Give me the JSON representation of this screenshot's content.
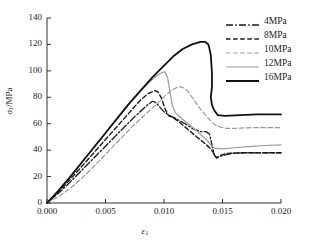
{
  "chart_data": {
    "type": "line",
    "title": "",
    "xlabel": "ε₁",
    "ylabel": "σ₁/MPa",
    "xlabel_main": "ε",
    "xlabel_sub": "1",
    "ylabel_main": "σ",
    "ylabel_sub": "1",
    "ylabel_unit": "/MPa",
    "xlim": [
      0.0,
      0.02
    ],
    "ylim": [
      0,
      140
    ],
    "xticks": [
      0.0,
      0.005,
      0.01,
      0.015,
      0.02
    ],
    "xtick_labels": [
      "0.000",
      "0.005",
      "0.010",
      "0.015",
      "0.020"
    ],
    "yticks": [
      0,
      20,
      40,
      60,
      80,
      100,
      120,
      140
    ],
    "ytick_labels": [
      "0",
      "20",
      "40",
      "60",
      "80",
      "100",
      "120",
      "140"
    ],
    "grid": false,
    "legend_position": "upper-right",
    "series": [
      {
        "name": "4MPa",
        "label": "4MPa",
        "style": "dashdot",
        "color": "#1a1a1a",
        "width": 1.3,
        "peak_strain": 0.009,
        "peak_stress": 77,
        "residual_stress": 38,
        "points": [
          [
            0.0,
            0
          ],
          [
            0.001,
            7.5
          ],
          [
            0.002,
            16
          ],
          [
            0.003,
            25
          ],
          [
            0.004,
            34
          ],
          [
            0.005,
            43
          ],
          [
            0.006,
            52
          ],
          [
            0.007,
            61
          ],
          [
            0.008,
            69.5
          ],
          [
            0.0085,
            73.5
          ],
          [
            0.009,
            77
          ],
          [
            0.0093,
            76
          ],
          [
            0.0096,
            73
          ],
          [
            0.01,
            69
          ],
          [
            0.0104,
            66.5
          ],
          [
            0.011,
            64
          ],
          [
            0.0118,
            60
          ],
          [
            0.0125,
            56
          ],
          [
            0.0131,
            54
          ],
          [
            0.0136,
            54
          ],
          [
            0.0139,
            52
          ],
          [
            0.0141,
            44
          ],
          [
            0.0143,
            36
          ],
          [
            0.0145,
            34.5
          ],
          [
            0.015,
            36
          ],
          [
            0.0158,
            37.6
          ],
          [
            0.017,
            38
          ],
          [
            0.0185,
            38
          ],
          [
            0.02,
            38
          ]
        ]
      },
      {
        "name": "8MPa",
        "label": "8MPa",
        "style": "dashed",
        "color": "#1a1a1a",
        "width": 1.4,
        "peak_strain": 0.0092,
        "peak_stress": 85,
        "residual_stress": 38,
        "points": [
          [
            0.0,
            0
          ],
          [
            0.001,
            8.5
          ],
          [
            0.002,
            18
          ],
          [
            0.003,
            28
          ],
          [
            0.004,
            38
          ],
          [
            0.005,
            48
          ],
          [
            0.006,
            58
          ],
          [
            0.007,
            68
          ],
          [
            0.008,
            78
          ],
          [
            0.0086,
            82.5
          ],
          [
            0.0092,
            85
          ],
          [
            0.0095,
            84
          ],
          [
            0.0098,
            79
          ],
          [
            0.0101,
            71
          ],
          [
            0.0104,
            66
          ],
          [
            0.0108,
            64.5
          ],
          [
            0.0112,
            62
          ],
          [
            0.012,
            56
          ],
          [
            0.0128,
            50
          ],
          [
            0.0135,
            45
          ],
          [
            0.014,
            41
          ],
          [
            0.0143,
            37
          ],
          [
            0.0145,
            34
          ],
          [
            0.0148,
            36
          ],
          [
            0.0153,
            37.5
          ],
          [
            0.0165,
            38
          ],
          [
            0.018,
            38
          ],
          [
            0.02,
            38
          ]
        ]
      },
      {
        "name": "10MPa",
        "label": "10MPa",
        "style": "dashed",
        "color": "#9a9a9a",
        "width": 1.2,
        "peak_strain": 0.0112,
        "peak_stress": 88,
        "residual_stress": 57,
        "points": [
          [
            0.0,
            0
          ],
          [
            0.0012,
            6
          ],
          [
            0.0024,
            14
          ],
          [
            0.0036,
            24
          ],
          [
            0.0048,
            35
          ],
          [
            0.006,
            46
          ],
          [
            0.0072,
            57
          ],
          [
            0.0084,
            67
          ],
          [
            0.0094,
            75
          ],
          [
            0.0102,
            82
          ],
          [
            0.0108,
            86
          ],
          [
            0.0112,
            88
          ],
          [
            0.0116,
            87.5
          ],
          [
            0.012,
            85
          ],
          [
            0.0124,
            80
          ],
          [
            0.0128,
            75
          ],
          [
            0.0132,
            70
          ],
          [
            0.0136,
            66
          ],
          [
            0.014,
            62
          ],
          [
            0.0144,
            59
          ],
          [
            0.0148,
            57.5
          ],
          [
            0.0153,
            56.5
          ],
          [
            0.016,
            56.5
          ],
          [
            0.0175,
            57
          ],
          [
            0.019,
            57
          ],
          [
            0.02,
            57
          ]
        ]
      },
      {
        "name": "12MPa",
        "label": "12MPa",
        "style": "solid",
        "color": "#9a9a9a",
        "width": 1.2,
        "peak_strain": 0.01,
        "peak_stress": 99,
        "residual_stress": 44,
        "points": [
          [
            0.0,
            0
          ],
          [
            0.001,
            9.5
          ],
          [
            0.002,
            20
          ],
          [
            0.003,
            31
          ],
          [
            0.004,
            42
          ],
          [
            0.005,
            53
          ],
          [
            0.006,
            64
          ],
          [
            0.007,
            75
          ],
          [
            0.008,
            85
          ],
          [
            0.0088,
            92
          ],
          [
            0.0094,
            96.5
          ],
          [
            0.0099,
            99
          ],
          [
            0.0101,
            99
          ],
          [
            0.0103,
            95
          ],
          [
            0.0105,
            85
          ],
          [
            0.0107,
            74
          ],
          [
            0.011,
            68
          ],
          [
            0.0115,
            64
          ],
          [
            0.0122,
            59
          ],
          [
            0.013,
            53
          ],
          [
            0.0136,
            48
          ],
          [
            0.014,
            44
          ],
          [
            0.0143,
            41.5
          ],
          [
            0.015,
            41
          ],
          [
            0.016,
            41.8
          ],
          [
            0.0172,
            42.6
          ],
          [
            0.0186,
            43.5
          ],
          [
            0.02,
            44
          ]
        ]
      },
      {
        "name": "16MPa",
        "label": "16MPa",
        "style": "solid",
        "color": "#111111",
        "width": 1.8,
        "peak_strain": 0.0135,
        "peak_stress": 122,
        "residual_stress": 67,
        "points": [
          [
            0.0,
            0
          ],
          [
            0.001,
            9.5
          ],
          [
            0.002,
            20
          ],
          [
            0.003,
            31
          ],
          [
            0.004,
            42
          ],
          [
            0.005,
            53
          ],
          [
            0.006,
            64
          ],
          [
            0.007,
            75
          ],
          [
            0.008,
            85
          ],
          [
            0.009,
            95
          ],
          [
            0.01,
            104
          ],
          [
            0.0108,
            111
          ],
          [
            0.0116,
            116.5
          ],
          [
            0.0124,
            120
          ],
          [
            0.0131,
            122
          ],
          [
            0.0135,
            122
          ],
          [
            0.0138,
            120
          ],
          [
            0.014,
            112
          ],
          [
            0.0141,
            98
          ],
          [
            0.0141,
            88
          ],
          [
            0.014,
            80
          ],
          [
            0.0141,
            74
          ],
          [
            0.0143,
            70
          ],
          [
            0.0146,
            66.5
          ],
          [
            0.0152,
            66
          ],
          [
            0.0165,
            66.5
          ],
          [
            0.018,
            67
          ],
          [
            0.02,
            67
          ]
        ]
      }
    ]
  },
  "axes": {
    "tick_color": "#1a1a1a",
    "axis_color": "#1a1a1a"
  }
}
